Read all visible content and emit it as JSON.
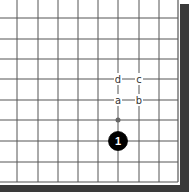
{
  "diagram": {
    "type": "go-board-corner",
    "corner": "bottom-right",
    "grid": {
      "vertical_x": [
        17,
        38,
        58,
        78,
        98,
        118,
        139,
        159
      ],
      "horizontal_y": [
        18,
        39,
        59,
        79,
        100,
        120,
        141,
        162
      ],
      "edge_x": 178,
      "edge_y": 182,
      "line_color": "#555555",
      "border_color": "#3a3a3a"
    },
    "stones": [
      {
        "color": "black",
        "number": "1",
        "x": 118,
        "y": 141
      }
    ],
    "markers": [
      {
        "type": "small-dot",
        "x": 118,
        "y": 120
      }
    ],
    "labels": [
      {
        "text": "d",
        "x": 118,
        "y": 79
      },
      {
        "text": "c",
        "x": 139,
        "y": 79
      },
      {
        "text": "a",
        "x": 118,
        "y": 100
      },
      {
        "text": "b",
        "x": 139,
        "y": 100
      }
    ]
  }
}
